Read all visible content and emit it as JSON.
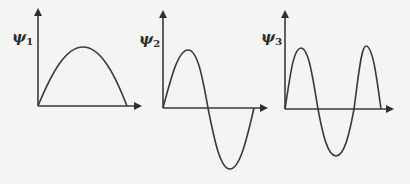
{
  "figure": {
    "panels": [
      {
        "id": "psi1",
        "symbol": "ψ",
        "subscript": "1",
        "nodes": 0,
        "description": "Ground state wavefunction: half sine wave, single positive lobe"
      },
      {
        "id": "psi2",
        "symbol": "ψ",
        "subscript": "2",
        "nodes": 1,
        "description": "First excited state: one full sine period, positive then negative lobe"
      },
      {
        "id": "psi3",
        "symbol": "ψ",
        "subscript": "3",
        "nodes": 2,
        "description": "Second excited state: one and a half sine periods, positive-negative-positive lobes"
      }
    ],
    "colors": {
      "background": "#f4f4f2",
      "ink": "#3a3a3a"
    }
  }
}
